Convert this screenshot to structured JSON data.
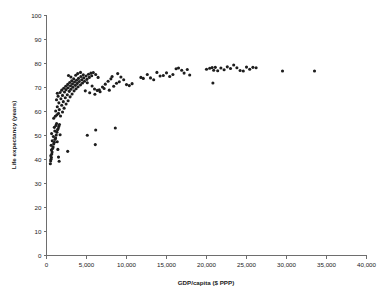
{
  "chart_data": {
    "type": "scatter",
    "title": "",
    "xlabel": "GDP/capita ($ PPP)",
    "ylabel": "Life expectancy (years)",
    "xlim": [
      0,
      40000
    ],
    "ylim": [
      0,
      100
    ],
    "xticks": [
      0,
      5000,
      10000,
      15000,
      20000,
      25000,
      30000,
      35000,
      40000
    ],
    "xticklabels": [
      "0",
      "5,000",
      "10,000",
      "15,000",
      "20,000",
      "25,000",
      "30,000",
      "35,000",
      "40,000"
    ],
    "yticks": [
      0,
      10,
      20,
      30,
      40,
      50,
      60,
      70,
      80,
      90,
      100
    ],
    "yticklabels": [
      "0",
      "10",
      "20",
      "30",
      "40",
      "50",
      "60",
      "70",
      "80",
      "90",
      "100"
    ],
    "grid": false,
    "legend": false,
    "marker": {
      "shape": "circle",
      "color": "#1d1d1d",
      "size": 3.1
    },
    "series": [
      {
        "name": "Countries",
        "points": [
          [
            480,
            38.2
          ],
          [
            520,
            39.4
          ],
          [
            560,
            40.1
          ],
          [
            610,
            40.8
          ],
          [
            540,
            41.6
          ],
          [
            660,
            42.3
          ],
          [
            700,
            43.1
          ],
          [
            620,
            44.0
          ],
          [
            760,
            44.6
          ],
          [
            830,
            45.2
          ],
          [
            580,
            45.9
          ],
          [
            900,
            46.5
          ],
          [
            980,
            47.2
          ],
          [
            720,
            47.8
          ],
          [
            1060,
            48.4
          ],
          [
            1140,
            49.0
          ],
          [
            860,
            49.6
          ],
          [
            1220,
            50.2
          ],
          [
            640,
            50.8
          ],
          [
            1300,
            51.4
          ],
          [
            1040,
            51.9
          ],
          [
            1380,
            52.4
          ],
          [
            1460,
            52.9
          ],
          [
            980,
            53.4
          ],
          [
            1540,
            53.8
          ],
          [
            1180,
            54.2
          ],
          [
            1620,
            54.6
          ],
          [
            1260,
            55.0
          ],
          [
            1700,
            50.3
          ],
          [
            1340,
            47.4
          ],
          [
            1420,
            44.2
          ],
          [
            1500,
            41.0
          ],
          [
            1580,
            39.3
          ],
          [
            2650,
            43.4
          ],
          [
            900,
            57.2
          ],
          [
            1100,
            58.0
          ],
          [
            1300,
            58.6
          ],
          [
            1500,
            59.2
          ],
          [
            1750,
            58.1
          ],
          [
            2000,
            59.8
          ],
          [
            1150,
            60.2
          ],
          [
            1600,
            60.8
          ],
          [
            2200,
            61.4
          ],
          [
            1350,
            62.0
          ],
          [
            1900,
            62.6
          ],
          [
            2450,
            63.1
          ],
          [
            1550,
            63.6
          ],
          [
            2100,
            64.1
          ],
          [
            2700,
            64.5
          ],
          [
            1250,
            64.9
          ],
          [
            1800,
            65.3
          ],
          [
            2350,
            65.7
          ],
          [
            2950,
            66.1
          ],
          [
            1450,
            66.4
          ],
          [
            2000,
            66.7
          ],
          [
            2600,
            67.0
          ],
          [
            3200,
            67.3
          ],
          [
            1350,
            67.6
          ],
          [
            1700,
            67.9
          ],
          [
            2250,
            68.1
          ],
          [
            2850,
            68.4
          ],
          [
            3450,
            68.6
          ],
          [
            1900,
            68.9
          ],
          [
            2450,
            69.1
          ],
          [
            3050,
            69.3
          ],
          [
            3700,
            69.5
          ],
          [
            2150,
            69.7
          ],
          [
            2700,
            69.9
          ],
          [
            3300,
            70.1
          ],
          [
            3950,
            70.3
          ],
          [
            2400,
            70.5
          ],
          [
            3000,
            70.7
          ],
          [
            3600,
            70.9
          ],
          [
            4250,
            71.1
          ],
          [
            2650,
            71.3
          ],
          [
            3250,
            71.5
          ],
          [
            3850,
            71.7
          ],
          [
            4500,
            71.9
          ],
          [
            2900,
            72.1
          ],
          [
            3500,
            72.3
          ],
          [
            4100,
            72.5
          ],
          [
            4750,
            72.6
          ],
          [
            3150,
            72.8
          ],
          [
            3750,
            73.0
          ],
          [
            4400,
            73.2
          ],
          [
            5050,
            73.4
          ],
          [
            3400,
            73.6
          ],
          [
            4000,
            73.8
          ],
          [
            4650,
            74.0
          ],
          [
            5350,
            74.2
          ],
          [
            3050,
            74.4
          ],
          [
            4300,
            74.6
          ],
          [
            4950,
            74.8
          ],
          [
            5650,
            74.9
          ],
          [
            3650,
            75.1
          ],
          [
            4600,
            75.3
          ],
          [
            5250,
            75.5
          ],
          [
            2750,
            75.0
          ],
          [
            3900,
            75.8
          ],
          [
            5550,
            76.0
          ],
          [
            4250,
            76.3
          ],
          [
            5850,
            76.2
          ],
          [
            6150,
            75.4
          ],
          [
            6450,
            74.2
          ],
          [
            5100,
            72.0
          ],
          [
            5700,
            70.6
          ],
          [
            6000,
            69.4
          ],
          [
            6350,
            68.8
          ],
          [
            6700,
            68.2
          ],
          [
            4850,
            68.6
          ],
          [
            5400,
            67.8
          ],
          [
            6050,
            67.2
          ],
          [
            6600,
            69.0
          ],
          [
            7000,
            70.2
          ],
          [
            7350,
            71.4
          ],
          [
            7700,
            72.6
          ],
          [
            8050,
            73.6
          ],
          [
            7200,
            69.6
          ],
          [
            7850,
            68.9
          ],
          [
            8400,
            70.5
          ],
          [
            8750,
            71.8
          ],
          [
            8200,
            74.6
          ],
          [
            8900,
            75.8
          ],
          [
            9300,
            74.4
          ],
          [
            9650,
            73.2
          ],
          [
            10000,
            71.2
          ],
          [
            10350,
            70.8
          ],
          [
            9100,
            72.4
          ],
          [
            10700,
            71.6
          ],
          [
            5100,
            50.1
          ],
          [
            6150,
            52.3
          ],
          [
            6100,
            46.2
          ],
          [
            8600,
            53.1
          ],
          [
            11800,
            74.2
          ],
          [
            12100,
            73.8
          ],
          [
            12600,
            75.4
          ],
          [
            13000,
            74.0
          ],
          [
            13400,
            73.2
          ],
          [
            13800,
            76.3
          ],
          [
            14200,
            74.8
          ],
          [
            14600,
            75.0
          ],
          [
            15000,
            76.1
          ],
          [
            15400,
            74.6
          ],
          [
            15800,
            75.4
          ],
          [
            16200,
            77.8
          ],
          [
            16500,
            78.1
          ],
          [
            16900,
            77.2
          ],
          [
            17200,
            76.0
          ],
          [
            17600,
            77.5
          ],
          [
            17900,
            75.2
          ],
          [
            20000,
            77.6
          ],
          [
            20400,
            78.0
          ],
          [
            20700,
            78.3
          ],
          [
            20900,
            77.2
          ],
          [
            21100,
            78.4
          ],
          [
            21400,
            77.0
          ],
          [
            20800,
            71.9
          ],
          [
            21800,
            78.1
          ],
          [
            22200,
            77.4
          ],
          [
            22600,
            78.6
          ],
          [
            23000,
            77.9
          ],
          [
            23400,
            79.4
          ],
          [
            23800,
            78.2
          ],
          [
            24200,
            77.1
          ],
          [
            24600,
            76.9
          ],
          [
            25000,
            78.5
          ],
          [
            25400,
            77.6
          ],
          [
            25800,
            78.4
          ],
          [
            26200,
            78.2
          ],
          [
            29500,
            76.9
          ],
          [
            33500,
            76.9
          ]
        ]
      }
    ]
  },
  "axes": {
    "x_title": "GDP/capita ($ PPP)",
    "y_title": "Life expectancy (years)"
  }
}
